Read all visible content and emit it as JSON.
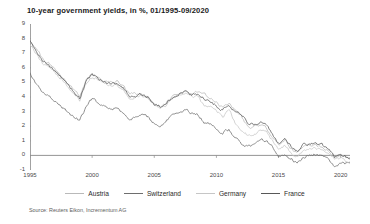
{
  "chart_data": {
    "type": "line",
    "title": "10-year government yields, in %, 01/1995-09/2020",
    "xlabel": "",
    "ylabel": "",
    "ylim": [
      -1,
      9
    ],
    "xlim": [
      1995,
      2020.75
    ],
    "yticks": [
      9,
      8,
      7,
      6,
      5,
      4,
      3,
      2,
      1,
      0,
      -1
    ],
    "xticks": [
      1995,
      2000,
      2005,
      2010,
      2015,
      2020
    ],
    "grid": false,
    "legend_position": "bottom",
    "source": "Source: Reuters Eikon, Incrementum AG",
    "x": [
      1995.0,
      1995.5,
      1996.0,
      1996.5,
      1997.0,
      1997.5,
      1998.0,
      1998.5,
      1999.0,
      1999.5,
      2000.0,
      2000.5,
      2001.0,
      2001.5,
      2002.0,
      2002.5,
      2003.0,
      2003.5,
      2004.0,
      2004.5,
      2005.0,
      2005.5,
      2006.0,
      2006.5,
      2007.0,
      2007.5,
      2008.0,
      2008.5,
      2009.0,
      2009.5,
      2010.0,
      2010.5,
      2011.0,
      2011.5,
      2012.0,
      2012.5,
      2013.0,
      2013.5,
      2014.0,
      2014.5,
      2015.0,
      2015.5,
      2016.0,
      2016.5,
      2017.0,
      2017.5,
      2018.0,
      2018.5,
      2019.0,
      2019.5,
      2020.0,
      2020.75
    ],
    "series": [
      {
        "name": "Austria",
        "color": "#b9b9b9",
        "values": [
          7.9,
          7.3,
          6.6,
          6.3,
          5.9,
          5.5,
          5.0,
          4.5,
          4.0,
          5.1,
          5.6,
          5.4,
          5.1,
          5.0,
          5.1,
          4.7,
          4.2,
          4.2,
          4.2,
          4.0,
          3.6,
          3.3,
          3.6,
          4.0,
          4.2,
          4.4,
          4.2,
          4.3,
          4.2,
          3.9,
          3.6,
          3.3,
          3.6,
          3.1,
          2.7,
          2.0,
          1.9,
          2.1,
          1.9,
          1.3,
          0.7,
          1.1,
          0.5,
          0.2,
          0.6,
          0.7,
          0.7,
          0.6,
          0.3,
          -0.1,
          0.0,
          -0.2
        ]
      },
      {
        "name": "Switzerland",
        "color": "#6e6e6e",
        "values": [
          5.6,
          4.9,
          4.3,
          4.1,
          3.7,
          3.4,
          3.0,
          2.6,
          2.4,
          3.3,
          3.9,
          3.6,
          3.3,
          3.1,
          3.3,
          2.8,
          2.4,
          2.6,
          2.8,
          2.6,
          2.2,
          2.0,
          2.4,
          2.7,
          2.9,
          3.1,
          2.9,
          2.8,
          2.3,
          2.1,
          1.9,
          1.5,
          1.8,
          1.2,
          0.8,
          0.6,
          0.7,
          1.1,
          1.0,
          0.6,
          0.0,
          0.0,
          -0.3,
          -0.5,
          -0.1,
          0.0,
          0.1,
          0.0,
          -0.3,
          -0.7,
          -0.6,
          -0.5
        ]
      },
      {
        "name": "Germany",
        "color": "#c6c6c6",
        "values": [
          7.6,
          7.0,
          6.3,
          6.1,
          5.7,
          5.3,
          4.8,
          4.3,
          3.8,
          4.9,
          5.4,
          5.2,
          4.9,
          4.8,
          4.9,
          4.5,
          4.0,
          4.0,
          4.1,
          3.9,
          3.4,
          3.2,
          3.5,
          3.9,
          4.1,
          4.3,
          4.0,
          4.1,
          3.4,
          3.3,
          3.1,
          2.6,
          3.2,
          2.2,
          1.8,
          1.4,
          1.4,
          1.7,
          1.6,
          1.0,
          0.4,
          0.7,
          0.2,
          -0.1,
          0.3,
          0.4,
          0.5,
          0.4,
          0.1,
          -0.3,
          -0.2,
          -0.5
        ]
      },
      {
        "name": "France",
        "color": "#585858",
        "values": [
          7.8,
          7.2,
          6.5,
          6.2,
          5.8,
          5.4,
          4.9,
          4.4,
          3.9,
          5.0,
          5.5,
          5.3,
          5.0,
          4.9,
          5.0,
          4.6,
          4.1,
          4.1,
          4.2,
          4.0,
          3.5,
          3.3,
          3.6,
          4.0,
          4.2,
          4.4,
          4.1,
          4.2,
          3.9,
          3.7,
          3.4,
          3.1,
          3.5,
          3.0,
          2.9,
          2.2,
          2.1,
          2.3,
          2.1,
          1.4,
          0.8,
          1.2,
          0.6,
          0.2,
          0.8,
          0.8,
          0.8,
          0.7,
          0.4,
          -0.1,
          0.1,
          -0.2
        ]
      }
    ]
  },
  "chart": {
    "title": "10-year government yields, in %, 01/1995-09/2020",
    "source": "Source: Reuters Eikon, Incrementum AG",
    "ytick_labels": [
      "9",
      "8",
      "7",
      "6",
      "5",
      "4",
      "3",
      "2",
      "1",
      "0",
      "-1"
    ],
    "xtick_labels": [
      "1995",
      "2000",
      "2005",
      "2010",
      "2015",
      "2020"
    ],
    "legend": [
      {
        "label": "Austria",
        "color": "#b9b9b9"
      },
      {
        "label": "Switzerland",
        "color": "#6e6e6e"
      },
      {
        "label": "Germany",
        "color": "#c6c6c6"
      },
      {
        "label": "France",
        "color": "#585858"
      }
    ]
  }
}
